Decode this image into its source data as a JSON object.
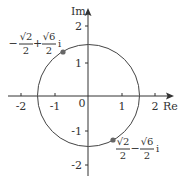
{
  "diagram": {
    "type": "complex-plane",
    "axes": {
      "x_label": "Re",
      "y_label": "Im",
      "origin_label": "0",
      "x_ticks": [
        {
          "value": -2,
          "label": "-2"
        },
        {
          "value": -1,
          "label": "-1"
        },
        {
          "value": 1,
          "label": "1"
        },
        {
          "value": 2,
          "label": "2"
        }
      ],
      "y_ticks": [
        {
          "value": 2,
          "label": "2"
        },
        {
          "value": 1,
          "label": "1"
        },
        {
          "value": -1,
          "label": "-1"
        },
        {
          "value": -2,
          "label": "-2"
        }
      ]
    },
    "circle": {
      "center": [
        0,
        0
      ],
      "radius_label": "√2"
    },
    "points": [
      {
        "name": "upper-left",
        "label": {
          "sign": "−",
          "frac1_num": "√2",
          "frac1_den": "2",
          "op": "+",
          "frac2_num": "√6",
          "frac2_den": "2",
          "unit": "i"
        }
      },
      {
        "name": "lower-right",
        "label": {
          "sign": "",
          "frac1_num": "√2",
          "frac1_den": "2",
          "op": "−",
          "frac2_num": "√6",
          "frac2_den": "2",
          "unit": "i"
        }
      }
    ],
    "colors": {
      "axis": "#333333",
      "circle": "#444444",
      "point": "#666666"
    }
  }
}
